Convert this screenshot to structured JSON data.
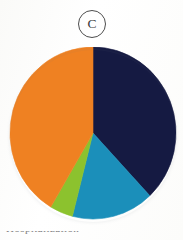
{
  "figure": {
    "panel_label": "C",
    "background_color": "#fdfdfc",
    "badge_border_color": "#4d4d4d",
    "caption_partial": "Hospitalization",
    "caption_visible": "top edge of caption text only, cropped"
  },
  "chart_data": {
    "type": "pie",
    "title": "C",
    "xlabel": "",
    "ylabel": "",
    "legend_position": "none",
    "grid": false,
    "labels": [
      "Segment 1",
      "Segment 2",
      "Segment 3",
      "Segment 4"
    ],
    "colors": [
      "#151a42",
      "#1b8fba",
      "#8cc22e",
      "#ef8122"
    ],
    "values": [
      38.0,
      16.0,
      4.5,
      41.5
    ],
    "units": "percent",
    "start_angle_deg": 0,
    "direction": "clockwise",
    "slices": [
      {
        "name": "Segment 1",
        "color": "#151a42",
        "color_name": "dark-navy",
        "value": 38.0,
        "start_angle_deg": 0,
        "end_angle_deg": 136.8
      },
      {
        "name": "Segment 2",
        "color": "#1b8fba",
        "color_name": "teal-blue",
        "value": 16.0,
        "start_angle_deg": 136.8,
        "end_angle_deg": 194.4
      },
      {
        "name": "Segment 3",
        "color": "#8cc22e",
        "color_name": "yellow-green",
        "value": 4.5,
        "start_angle_deg": 194.4,
        "end_angle_deg": 210.6
      },
      {
        "name": "Segment 4",
        "color": "#ef8122",
        "color_name": "orange",
        "value": 41.5,
        "start_angle_deg": 210.6,
        "end_angle_deg": 360.0
      }
    ],
    "geometry": {
      "center_x": 87,
      "center_y": 86,
      "radius_x": 83,
      "radius_y": 86
    }
  }
}
